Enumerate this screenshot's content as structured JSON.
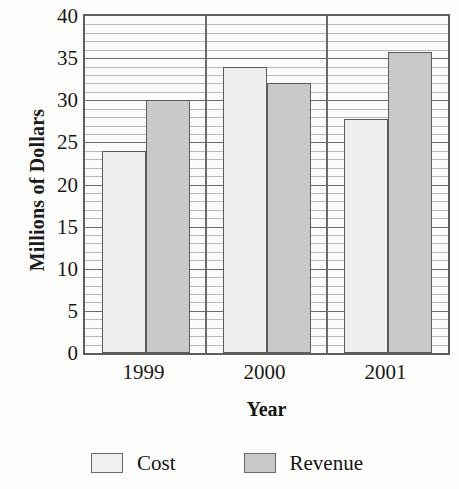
{
  "chart_data": {
    "type": "bar",
    "title": "",
    "subtitle": "",
    "xlabel": "Year",
    "ylabel": "Millions of Dollars",
    "categories": [
      "1999",
      "2000",
      "2001"
    ],
    "series": [
      {
        "name": "Cost",
        "values": [
          24,
          34,
          27.8
        ],
        "color": "#eeeeec"
      },
      {
        "name": "Revenue",
        "values": [
          30,
          32,
          35.7
        ],
        "color": "#c9c9c9"
      }
    ],
    "ylim": [
      0,
      40
    ],
    "ytick_values": [
      0,
      5,
      10,
      15,
      20,
      25,
      30,
      35,
      40
    ],
    "ytick_labels": [
      "0",
      "5",
      "10",
      "15",
      "20",
      "25",
      "30",
      "35",
      "40"
    ],
    "minor_tick_step": 1,
    "grid": {
      "horizontal_major": true,
      "horizontal_minor": true,
      "vertical_group_separators": true
    },
    "legend": {
      "position": "below-axes",
      "entries": [
        {
          "label": "Cost",
          "swatch": "cost-swatch"
        },
        {
          "label": "Revenue",
          "swatch": "revenue-swatch"
        }
      ]
    },
    "annotations": []
  }
}
